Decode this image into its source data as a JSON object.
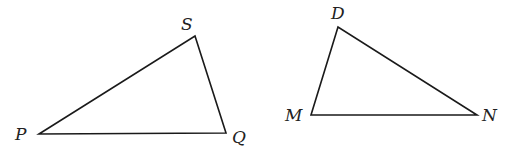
{
  "diagram": {
    "type": "two-triangles",
    "triangles": [
      {
        "name": "PQS",
        "vertices": [
          {
            "label": "P",
            "x": 39,
            "y": 134,
            "label_x": 15,
            "label_y": 140
          },
          {
            "label": "S",
            "x": 195,
            "y": 36,
            "label_x": 181,
            "label_y": 30
          },
          {
            "label": "Q",
            "x": 226,
            "y": 133,
            "label_x": 232,
            "label_y": 143
          }
        ]
      },
      {
        "name": "DMN",
        "vertices": [
          {
            "label": "D",
            "x": 338,
            "y": 27,
            "label_x": 331,
            "label_y": 19
          },
          {
            "label": "M",
            "x": 311,
            "y": 115,
            "label_x": 285,
            "label_y": 121
          },
          {
            "label": "N",
            "x": 477,
            "y": 115,
            "label_x": 482,
            "label_y": 121
          }
        ]
      }
    ],
    "colors": {
      "stroke": "#1a1a1a",
      "label": "#222222",
      "background": "#ffffff"
    }
  }
}
